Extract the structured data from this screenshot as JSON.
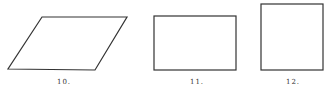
{
  "figures": [
    {
      "label": "10.",
      "shape": "parallelogram",
      "points": "42,17 127,17 95,70 8,69"
    },
    {
      "label": "11.",
      "shape": "rectangle",
      "x": 154,
      "y": 16,
      "w": 82,
      "h": 54
    },
    {
      "label": "12.",
      "shape": "square",
      "x": 261,
      "y": 4,
      "w": 62,
      "h": 66
    }
  ],
  "stroke_color": "#333333"
}
